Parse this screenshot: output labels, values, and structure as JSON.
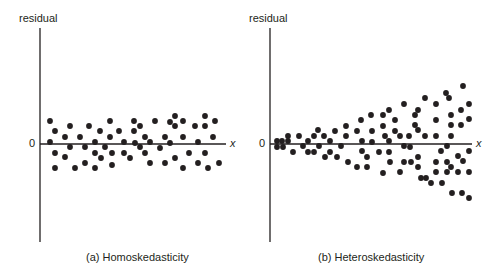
{
  "chart_data": [
    {
      "type": "scatter",
      "title": "(a) Homoskedasticity",
      "ylabel": "residual",
      "xlabel": "x",
      "zero_label": "0",
      "grid": false,
      "description": "Residuals scattered in a constant-width band around zero across all x",
      "points_px": [
        [
          50,
          121
        ],
        [
          55,
          131
        ],
        [
          50,
          142
        ],
        [
          55,
          153
        ],
        [
          55,
          168
        ],
        [
          65,
          137
        ],
        [
          65,
          157
        ],
        [
          70,
          126
        ],
        [
          70,
          147
        ],
        [
          75,
          168
        ],
        [
          80,
          137
        ],
        [
          85,
          147
        ],
        [
          85,
          163
        ],
        [
          89,
          126
        ],
        [
          95,
          142
        ],
        [
          95,
          153
        ],
        [
          95,
          168
        ],
        [
          100,
          131
        ],
        [
          101,
          158
        ],
        [
          105,
          147
        ],
        [
          110,
          121
        ],
        [
          110,
          137
        ],
        [
          112,
          153
        ],
        [
          112,
          165
        ],
        [
          119,
          131
        ],
        [
          124,
          142
        ],
        [
          124,
          153
        ],
        [
          130,
          158
        ],
        [
          134,
          121
        ],
        [
          134,
          131
        ],
        [
          135,
          143
        ],
        [
          140,
          147
        ],
        [
          140,
          126
        ],
        [
          145,
          137
        ],
        [
          145,
          153
        ],
        [
          150,
          142
        ],
        [
          150,
          163
        ],
        [
          155,
          121
        ],
        [
          160,
          148
        ],
        [
          165,
          137
        ],
        [
          165,
          163
        ],
        [
          170,
          122
        ],
        [
          170,
          143
        ],
        [
          175,
          116
        ],
        [
          175,
          126
        ],
        [
          175,
          158
        ],
        [
          183,
          121
        ],
        [
          183,
          137
        ],
        [
          183,
          168
        ],
        [
          189,
          153
        ],
        [
          195,
          126
        ],
        [
          198,
          142
        ],
        [
          198,
          163
        ],
        [
          205,
          116
        ],
        [
          205,
          126
        ],
        [
          205,
          153
        ],
        [
          208,
          168
        ],
        [
          213,
          137
        ],
        [
          215,
          121
        ],
        [
          219,
          163
        ]
      ]
    },
    {
      "type": "scatter",
      "title": "(b) Heteroskedasticity",
      "ylabel": "residual",
      "xlabel": "x",
      "zero_label": "0",
      "grid": false,
      "description": "Residual spread around zero increases as x increases (fan shape)",
      "points_px": [
        [
          277,
          141
        ],
        [
          277,
          147
        ],
        [
          282,
          141
        ],
        [
          283,
          147
        ],
        [
          288,
          141
        ],
        [
          288,
          136
        ],
        [
          293,
          152
        ],
        [
          299,
          136
        ],
        [
          303,
          146
        ],
        [
          308,
          141
        ],
        [
          308,
          152
        ],
        [
          314,
          136
        ],
        [
          314,
          152
        ],
        [
          318,
          130
        ],
        [
          319,
          146
        ],
        [
          324,
          136
        ],
        [
          325,
          157
        ],
        [
          330,
          152
        ],
        [
          330,
          141
        ],
        [
          335,
          131
        ],
        [
          337,
          157
        ],
        [
          341,
          146
        ],
        [
          346,
          126
        ],
        [
          346,
          136
        ],
        [
          348,
          162
        ],
        [
          357,
          131
        ],
        [
          357,
          167
        ],
        [
          361,
          120
        ],
        [
          362,
          141
        ],
        [
          362,
          151
        ],
        [
          367,
          157
        ],
        [
          367,
          167
        ],
        [
          371,
          115
        ],
        [
          372,
          131
        ],
        [
          372,
          142
        ],
        [
          379,
          152
        ],
        [
          383,
          115
        ],
        [
          383,
          126
        ],
        [
          383,
          173
        ],
        [
          385,
          136
        ],
        [
          389,
          110
        ],
        [
          389,
          141
        ],
        [
          389,
          152
        ],
        [
          390,
          162
        ],
        [
          395,
          120
        ],
        [
          395,
          131
        ],
        [
          400,
          136
        ],
        [
          400,
          172
        ],
        [
          404,
          146
        ],
        [
          404,
          162
        ],
        [
          404,
          104
        ],
        [
          409,
          136
        ],
        [
          410,
          147
        ],
        [
          411,
          162
        ],
        [
          415,
          115
        ],
        [
          415,
          125
        ],
        [
          418,
          110
        ],
        [
          418,
          130
        ],
        [
          418,
          157
        ],
        [
          418,
          167
        ],
        [
          421,
          178
        ],
        [
          425,
          136
        ],
        [
          425,
          98
        ],
        [
          426,
          178
        ],
        [
          431,
          183
        ],
        [
          436,
          104
        ],
        [
          436,
          120
        ],
        [
          436,
          136
        ],
        [
          436,
          162
        ],
        [
          436,
          172
        ],
        [
          441,
          151
        ],
        [
          442,
          183
        ],
        [
          446,
          93
        ],
        [
          447,
          146
        ],
        [
          447,
          162
        ],
        [
          447,
          172
        ],
        [
          449,
          98
        ],
        [
          451,
          115
        ],
        [
          451,
          125
        ],
        [
          451,
          136
        ],
        [
          451,
          167
        ],
        [
          452,
          193
        ],
        [
          458,
          156
        ],
        [
          458,
          172
        ],
        [
          461,
          110
        ],
        [
          461,
          125
        ],
        [
          462,
          193
        ],
        [
          463,
          86
        ],
        [
          463,
          161
        ],
        [
          469,
          104
        ],
        [
          469,
          119
        ],
        [
          469,
          151
        ],
        [
          469,
          172
        ],
        [
          469,
          198
        ]
      ]
    }
  ],
  "panels": [
    {
      "ylabel": "residual",
      "zero": "0",
      "xlabel": "x",
      "caption": "(a) Homoskedasticity"
    },
    {
      "ylabel": "residual",
      "zero": "0",
      "xlabel": "x",
      "caption": "(b) Heteroskedasticity"
    }
  ],
  "colors": {
    "ink": "#231f20",
    "background": "#ffffff"
  }
}
